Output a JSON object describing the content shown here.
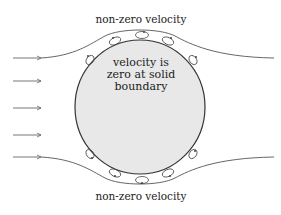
{
  "diagram": {
    "top_label": "non-zero velocity",
    "bottom_label": "non-zero velocity",
    "center_label": [
      "velocity is",
      "zero at solid",
      "boundary"
    ],
    "colors": {
      "body_fill": "#e8e8e8",
      "body_stroke": "#333333",
      "streamline": "#555555",
      "arrow": "#666666",
      "text": "#222222"
    },
    "inflow_arrows": 5,
    "top_vortices": 5,
    "bottom_vortices": 5
  }
}
